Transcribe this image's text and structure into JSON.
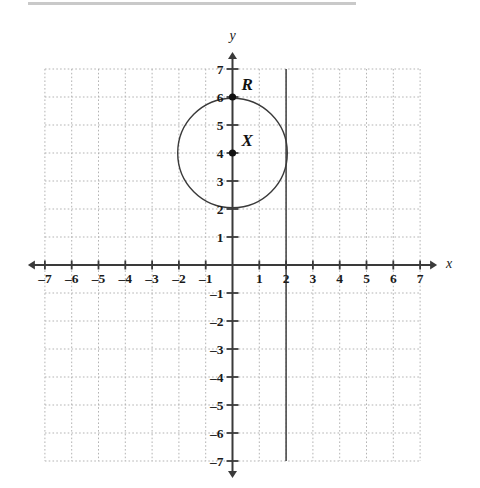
{
  "figure": {
    "kind": "coordinate-plane",
    "top_rule_color": "#c9c9c9"
  },
  "chart_data": {
    "type": "scatter",
    "title": "",
    "xlabel": "x",
    "ylabel": "y",
    "xlim": [
      -7,
      7
    ],
    "ylim": [
      -7,
      7
    ],
    "grid": true,
    "grid_step": 1,
    "grid_color": "#b3b3b3",
    "grid_style": "dotted",
    "axis_color": "#3a3a3a",
    "legend": "none",
    "x_tick_labels": [
      "-7",
      "-6",
      "-5",
      "-4",
      "-3",
      "-2",
      "-1",
      "1",
      "2",
      "3",
      "4",
      "5",
      "6",
      "7"
    ],
    "x_tick_values": [
      -7,
      -6,
      -5,
      -4,
      -3,
      -2,
      -1,
      1,
      2,
      3,
      4,
      5,
      6,
      7
    ],
    "y_tick_labels": [
      "7",
      "6",
      "5",
      "4",
      "3",
      "2",
      "1",
      "-1",
      "-2",
      "-3",
      "-4",
      "-5",
      "-6",
      "-7"
    ],
    "y_tick_values": [
      7,
      6,
      5,
      4,
      3,
      2,
      1,
      -1,
      -2,
      -3,
      -4,
      -5,
      -6,
      -7
    ],
    "points": [
      {
        "label": "R",
        "x": 0,
        "y": 6,
        "color": "#111111"
      },
      {
        "label": "X",
        "x": 0,
        "y": 4,
        "color": "#111111"
      }
    ],
    "shapes": [
      {
        "type": "circle",
        "center_x": 0,
        "center_y": 4,
        "radius": 2,
        "stroke": "#3a3a3a",
        "fill": "none"
      },
      {
        "type": "vertical-line",
        "x": 2,
        "y_start": -7,
        "y_end": 7,
        "stroke": "#4a4a4a"
      }
    ],
    "annotations": [
      {
        "text": "R",
        "x": 0,
        "y": 6,
        "placement": "upper-right"
      },
      {
        "text": "X",
        "x": 0,
        "y": 4,
        "placement": "upper-right"
      }
    ]
  }
}
